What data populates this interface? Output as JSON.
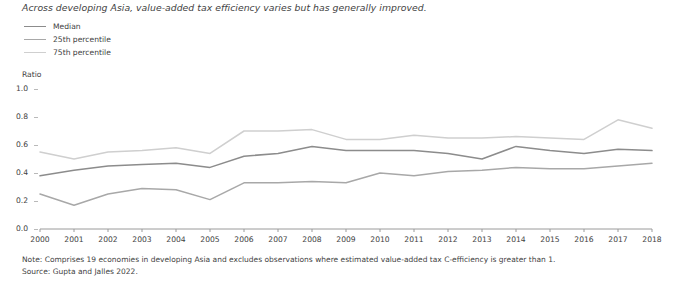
{
  "title": "Across developing Asia, value-added tax efficiency varies but has generally improved.",
  "axis": {
    "ylabel": "Ratio",
    "yticks": [
      "0.0",
      "0.2",
      "0.4",
      "0.6",
      "0.8",
      "1.0"
    ]
  },
  "notes": {
    "note": "Note: Comprises 19 economies in developing Asia and excludes observations where estimated value-added tax C-efficiency is greater than 1.",
    "source": "Source: Gupta and Jalles 2022."
  },
  "colors": {
    "median": "#8c8c8c",
    "p25": "#a8a8a8",
    "p75": "#cfcfcf",
    "axis": "#9a9a9a",
    "text": "#3f3f3f"
  },
  "chart_data": {
    "type": "line",
    "title": "Across developing Asia, value-added tax efficiency varies but has generally improved.",
    "xlabel": "",
    "ylabel": "Ratio",
    "ylim": [
      0.0,
      1.0
    ],
    "xlim": [
      2000,
      2018
    ],
    "grid": false,
    "legend_position": "top-left",
    "categories": [
      "2000",
      "2001",
      "2002",
      "2003",
      "2004",
      "2005",
      "2006",
      "2007",
      "2008",
      "2009",
      "2010",
      "2011",
      "2012",
      "2013",
      "2014",
      "2015",
      "2016",
      "2017",
      "2018"
    ],
    "x": [
      2000,
      2001,
      2002,
      2003,
      2004,
      2005,
      2006,
      2007,
      2008,
      2009,
      2010,
      2011,
      2012,
      2013,
      2014,
      2015,
      2016,
      2017,
      2018
    ],
    "series": [
      {
        "name": "Median",
        "color": "#8c8c8c",
        "values": [
          0.38,
          0.42,
          0.45,
          0.46,
          0.47,
          0.44,
          0.52,
          0.54,
          0.59,
          0.56,
          0.56,
          0.56,
          0.54,
          0.5,
          0.59,
          0.56,
          0.54,
          0.57,
          0.56
        ]
      },
      {
        "name": "25th percentile",
        "color": "#a8a8a8",
        "values": [
          0.25,
          0.17,
          0.25,
          0.29,
          0.28,
          0.21,
          0.33,
          0.33,
          0.34,
          0.33,
          0.4,
          0.38,
          0.41,
          0.42,
          0.44,
          0.43,
          0.43,
          0.45,
          0.47
        ]
      },
      {
        "name": "75th percentile",
        "color": "#cfcfcf",
        "values": [
          0.55,
          0.5,
          0.55,
          0.56,
          0.58,
          0.54,
          0.7,
          0.7,
          0.71,
          0.64,
          0.64,
          0.67,
          0.65,
          0.65,
          0.66,
          0.65,
          0.64,
          0.78,
          0.72
        ]
      }
    ]
  }
}
